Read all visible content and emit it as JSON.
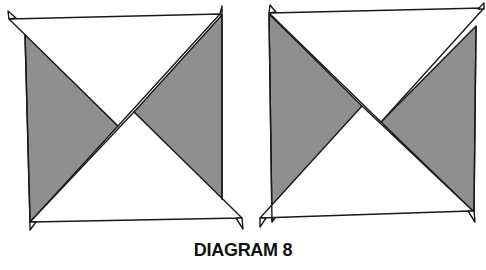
{
  "caption": "DIAGRAM 8",
  "colors": {
    "shade": "#8f8f8f",
    "paper": "#ffffff",
    "stroke": "#1a1a1a"
  },
  "figures": [
    {
      "id": "left-square",
      "description": "Square with top and bottom white triangular flaps; left and right grey triangles visible; flaps cross near center"
    },
    {
      "id": "right-square",
      "description": "Square with top and bottom white triangular flaps; left and right grey triangles visible; diagonals cross slightly right of center"
    }
  ]
}
